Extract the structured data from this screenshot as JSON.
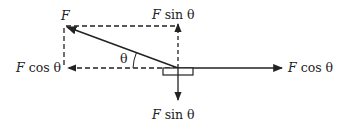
{
  "diagram": {
    "type": "force-decomposition",
    "colors": {
      "stroke": "#222222",
      "background": "#ffffff"
    },
    "labels": {
      "force": "F",
      "angle": "θ",
      "top_component": {
        "var": "F",
        "fn": " sin θ"
      },
      "bottom_component": {
        "var": "F",
        "fn": " sin θ"
      },
      "left_component": {
        "var": "F",
        "fn": " cos θ"
      },
      "right_component": {
        "var": "F",
        "fn": " cos θ"
      }
    },
    "elements": [
      {
        "name": "applied-force-arrow",
        "style": "solid",
        "direction": "up-left"
      },
      {
        "name": "vertical-component-up",
        "style": "dashed",
        "direction": "up"
      },
      {
        "name": "horizontal-component-left",
        "style": "dashed",
        "direction": "left"
      },
      {
        "name": "vertical-component-down",
        "style": "solid",
        "direction": "down"
      },
      {
        "name": "horizontal-component-right",
        "style": "solid",
        "direction": "right"
      },
      {
        "name": "block",
        "shape": "rectangle"
      }
    ]
  }
}
